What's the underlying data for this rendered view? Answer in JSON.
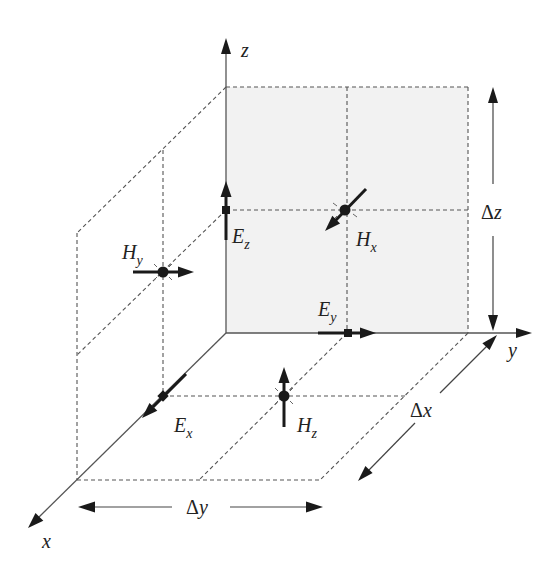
{
  "colors": {
    "back_face_fill": "#f2f2f2",
    "dashed_lines": "#555555",
    "arrows": "#1a1a1a",
    "labels": "#222222"
  },
  "axes": {
    "x": "x",
    "y": "y",
    "z": "z"
  },
  "fields": {
    "Ex": {
      "symbol": "E",
      "sub": "x"
    },
    "Ey": {
      "symbol": "E",
      "sub": "y"
    },
    "Ez": {
      "symbol": "E",
      "sub": "z"
    },
    "Hx": {
      "symbol": "H",
      "sub": "x"
    },
    "Hy": {
      "symbol": "H",
      "sub": "y"
    },
    "Hz": {
      "symbol": "H",
      "sub": "z"
    }
  },
  "dimensions": {
    "dx": {
      "delta": "Δ",
      "var": "x"
    },
    "dy": {
      "delta": "Δ",
      "var": "y"
    },
    "dz": {
      "delta": "Δ",
      "var": "z"
    }
  }
}
